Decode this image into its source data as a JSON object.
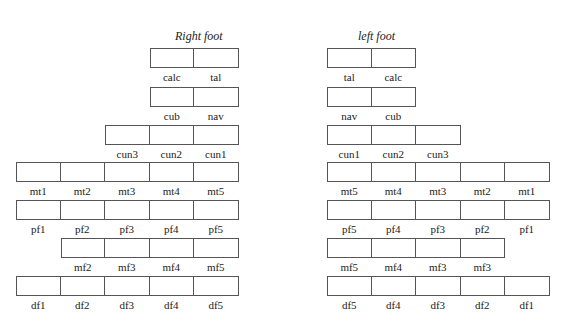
{
  "right_foot": {
    "title": "Right foot",
    "rows": [
      {
        "name": "tarsal-row-1",
        "start_col": 3,
        "labels": [
          "calc",
          "tal"
        ]
      },
      {
        "name": "tarsal-row-2",
        "start_col": 3,
        "labels": [
          "cub",
          "nav"
        ]
      },
      {
        "name": "cuneiform-row",
        "start_col": 2,
        "labels": [
          "cun3",
          "cun2",
          "cun1"
        ]
      },
      {
        "name": "metatarsal-row",
        "start_col": 0,
        "labels": [
          "mt1",
          "mt2",
          "mt3",
          "mt4",
          "mt5"
        ]
      },
      {
        "name": "proximal-phalanx-row",
        "start_col": 0,
        "labels": [
          "pf1",
          "pf2",
          "pf3",
          "pf4",
          "pf5"
        ]
      },
      {
        "name": "middle-phalanx-row",
        "start_col": 1,
        "labels": [
          "mf2",
          "mf3",
          "mf4",
          "mf5"
        ]
      },
      {
        "name": "distal-phalanx-row",
        "start_col": 0,
        "labels": [
          "df1",
          "df2",
          "df3",
          "df4",
          "df5"
        ]
      }
    ]
  },
  "left_foot": {
    "title": "left foot",
    "rows": [
      {
        "name": "tarsal-row-1",
        "start_col": 0,
        "labels": [
          "tal",
          "calc"
        ]
      },
      {
        "name": "tarsal-row-2",
        "start_col": 0,
        "labels": [
          "nav",
          "cub"
        ]
      },
      {
        "name": "cuneiform-row",
        "start_col": 0,
        "labels": [
          "cun1",
          "cun2",
          "cun3"
        ]
      },
      {
        "name": "metatarsal-row",
        "start_col": 0,
        "labels": [
          "mt5",
          "mt4",
          "mt3",
          "mt2",
          "mt1"
        ]
      },
      {
        "name": "proximal-phalanx-row",
        "start_col": 0,
        "labels": [
          "pf5",
          "pf4",
          "pf3",
          "pf2",
          "pf1"
        ]
      },
      {
        "name": "middle-phalanx-row",
        "start_col": 0,
        "labels": [
          "mf5",
          "mf4",
          "mf3",
          "mf3"
        ]
      },
      {
        "name": "distal-phalanx-row",
        "start_col": 0,
        "labels": [
          "df5",
          "df4",
          "df3",
          "df2",
          "df1"
        ]
      }
    ]
  }
}
